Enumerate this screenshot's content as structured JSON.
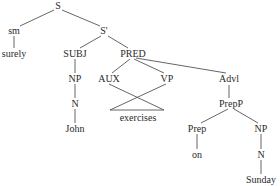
{
  "diagram": {
    "type": "syntax-tree",
    "nodes": [
      {
        "id": "S",
        "label": "S",
        "x": 58,
        "y": 6
      },
      {
        "id": "sm",
        "label": "sm",
        "x": 14,
        "y": 31
      },
      {
        "id": "surely",
        "label": "surely",
        "x": 14,
        "y": 54
      },
      {
        "id": "Sprime",
        "label": "S'",
        "x": 104,
        "y": 31
      },
      {
        "id": "SUBJ",
        "label": "SUBJ",
        "x": 75,
        "y": 54
      },
      {
        "id": "NP1",
        "label": "NP",
        "x": 75,
        "y": 79
      },
      {
        "id": "N1",
        "label": "N",
        "x": 75,
        "y": 104
      },
      {
        "id": "John",
        "label": "John",
        "x": 75,
        "y": 129
      },
      {
        "id": "PRED",
        "label": "PRED",
        "x": 133,
        "y": 54
      },
      {
        "id": "AUX",
        "label": "AUX",
        "x": 109,
        "y": 79
      },
      {
        "id": "VP",
        "label": "VP",
        "x": 167,
        "y": 79
      },
      {
        "id": "exercises",
        "label": "exercises",
        "x": 138,
        "y": 118
      },
      {
        "id": "Advl",
        "label": "Advl",
        "x": 229,
        "y": 79
      },
      {
        "id": "PrepP",
        "label": "PrepP",
        "x": 231,
        "y": 104
      },
      {
        "id": "Prep",
        "label": "Prep",
        "x": 197,
        "y": 129
      },
      {
        "id": "on",
        "label": "on",
        "x": 197,
        "y": 155
      },
      {
        "id": "NP2",
        "label": "NP",
        "x": 261,
        "y": 129
      },
      {
        "id": "N2",
        "label": "N",
        "x": 261,
        "y": 155
      },
      {
        "id": "Sunday",
        "label": "Sunday",
        "x": 261,
        "y": 180
      }
    ],
    "edges": [
      {
        "x1": 54,
        "y1": 10,
        "x2": 20,
        "y2": 26
      },
      {
        "x1": 62,
        "y1": 10,
        "x2": 100,
        "y2": 26
      },
      {
        "x1": 14,
        "y1": 36,
        "x2": 14,
        "y2": 48
      },
      {
        "x1": 101,
        "y1": 36,
        "x2": 80,
        "y2": 48
      },
      {
        "x1": 108,
        "y1": 36,
        "x2": 128,
        "y2": 48
      },
      {
        "x1": 75,
        "y1": 59,
        "x2": 75,
        "y2": 73
      },
      {
        "x1": 75,
        "y1": 84,
        "x2": 75,
        "y2": 98
      },
      {
        "x1": 75,
        "y1": 109,
        "x2": 75,
        "y2": 123
      },
      {
        "x1": 130,
        "y1": 59,
        "x2": 112,
        "y2": 73
      },
      {
        "x1": 134,
        "y1": 59,
        "x2": 164,
        "y2": 73
      },
      {
        "x1": 136,
        "y1": 58,
        "x2": 226,
        "y2": 73
      },
      {
        "x1": 109,
        "y1": 84,
        "x2": 164,
        "y2": 110
      },
      {
        "x1": 166,
        "y1": 84,
        "x2": 110,
        "y2": 110
      },
      {
        "x1": 110,
        "y1": 110,
        "x2": 164,
        "y2": 110
      },
      {
        "x1": 229,
        "y1": 85,
        "x2": 229,
        "y2": 98
      },
      {
        "x1": 228,
        "y1": 109,
        "x2": 201,
        "y2": 123
      },
      {
        "x1": 234,
        "y1": 109,
        "x2": 258,
        "y2": 123
      },
      {
        "x1": 197,
        "y1": 134,
        "x2": 197,
        "y2": 149
      },
      {
        "x1": 261,
        "y1": 134,
        "x2": 261,
        "y2": 149
      },
      {
        "x1": 261,
        "y1": 160,
        "x2": 261,
        "y2": 174
      }
    ],
    "colors": {
      "line": "#555555",
      "text": "#2a2a2a",
      "background": "#ffffff"
    }
  }
}
